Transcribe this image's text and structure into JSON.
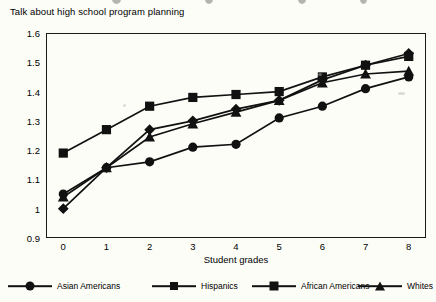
{
  "chart_data": {
    "type": "line",
    "title": "Talk about high school program planning",
    "xlabel": "Student grades",
    "ylabel": "",
    "x": [
      0,
      1,
      2,
      3,
      4,
      5,
      6,
      7,
      8
    ],
    "xtick_labels": [
      "0",
      "1",
      "2",
      "3",
      "4",
      "5",
      "6",
      "7",
      "8"
    ],
    "ytick_labels": [
      "0.9",
      "1",
      "1.1",
      "1.2",
      "1.3",
      "1.4",
      "1.5",
      "1.6"
    ],
    "ytick_values": [
      0.9,
      1.0,
      1.1,
      1.2,
      1.3,
      1.4,
      1.5,
      1.6
    ],
    "ylim": [
      0.9,
      1.6
    ],
    "xlim": [
      -0.4,
      8.4
    ],
    "grid": false,
    "legend_position": "bottom",
    "line_color": "#111111",
    "series": [
      {
        "name": "Asian Americans",
        "marker": "circle",
        "values": [
          1.05,
          1.14,
          1.16,
          1.21,
          1.22,
          1.31,
          1.35,
          1.41,
          1.45
        ]
      },
      {
        "name": "Hispanics",
        "marker": "diamond",
        "values": [
          1.0,
          1.14,
          1.27,
          1.3,
          1.34,
          1.37,
          1.44,
          1.49,
          1.53
        ]
      },
      {
        "name": "African Americans",
        "marker": "square",
        "values": [
          1.19,
          1.27,
          1.35,
          1.38,
          1.39,
          1.4,
          1.45,
          1.49,
          1.52
        ]
      },
      {
        "name": "Whites",
        "marker": "triangle",
        "values": [
          1.04,
          1.14,
          1.245,
          1.29,
          1.33,
          1.37,
          1.43,
          1.46,
          1.47
        ]
      }
    ]
  },
  "legend": {
    "items": [
      {
        "label": "Asian Americans",
        "marker": "circle"
      },
      {
        "label": "Hispanics",
        "marker": "diamond"
      },
      {
        "label": "African Americans",
        "marker": "square"
      },
      {
        "label": "Whites",
        "marker": "triangle"
      }
    ]
  }
}
